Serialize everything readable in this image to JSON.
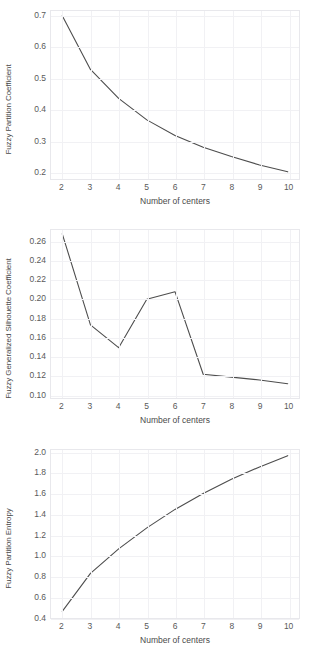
{
  "figure": {
    "background": "#ffffff",
    "line_color": "#4d4d4d",
    "grid_color": "#f1f1f4",
    "panel_border_color": "#e8e8ec"
  },
  "chart_data": [
    {
      "type": "line",
      "title": "",
      "xlabel": "Number of centers",
      "ylabel": "Fuzzy Partition Coefficient",
      "x": [
        2,
        3,
        4,
        5,
        6,
        7,
        8,
        9,
        10
      ],
      "values": [
        0.7,
        0.527,
        0.434,
        0.365,
        0.315,
        0.277,
        0.247,
        0.22,
        0.198
      ],
      "xlim": [
        1.6,
        10.4
      ],
      "ylim": [
        0.175,
        0.715
      ],
      "xticks": [
        2,
        3,
        4,
        5,
        6,
        7,
        8,
        9,
        10
      ],
      "xticklabels": [
        "2",
        "3",
        "4",
        "5",
        "6",
        "7",
        "8",
        "9",
        "10"
      ],
      "yticks": [
        0.2,
        0.3,
        0.4,
        0.5,
        0.6,
        0.7
      ],
      "yticklabels": [
        "0.2",
        "0.3",
        "0.4",
        "0.5",
        "0.6",
        "0.7"
      ],
      "grid": true,
      "legend": "none"
    },
    {
      "type": "line",
      "title": "",
      "xlabel": "Number of centers",
      "ylabel": "Fuzzy Generalized Silhouette Coefficient",
      "x": [
        2,
        3,
        4,
        5,
        6,
        7,
        8,
        9,
        10
      ],
      "values": [
        0.268,
        0.172,
        0.148,
        0.199,
        0.207,
        0.12,
        0.117,
        0.114,
        0.11
      ],
      "xlim": [
        1.6,
        10.4
      ],
      "ylim": [
        0.095,
        0.272
      ],
      "xticks": [
        2,
        3,
        4,
        5,
        6,
        7,
        8,
        9,
        10
      ],
      "xticklabels": [
        "2",
        "3",
        "4",
        "5",
        "6",
        "7",
        "8",
        "9",
        "10"
      ],
      "yticks": [
        0.1,
        0.12,
        0.14,
        0.16,
        0.18,
        0.2,
        0.22,
        0.24,
        0.26
      ],
      "yticklabels": [
        "0.10",
        "0.12",
        "0.14",
        "0.16",
        "0.18",
        "0.20",
        "0.22",
        "0.24",
        "0.26"
      ],
      "grid": true,
      "legend": "none"
    },
    {
      "type": "line",
      "title": "",
      "xlabel": "Number of centers",
      "ylabel": "Fuzzy Partition Entropy",
      "x": [
        2,
        3,
        4,
        5,
        6,
        7,
        8,
        9,
        10
      ],
      "values": [
        0.455,
        0.825,
        1.065,
        1.27,
        1.45,
        1.605,
        1.745,
        1.865,
        1.975
      ],
      "xlim": [
        1.6,
        10.4
      ],
      "ylim": [
        0.39,
        2.03
      ],
      "xticks": [
        2,
        3,
        4,
        5,
        6,
        7,
        8,
        9,
        10
      ],
      "xticklabels": [
        "2",
        "3",
        "4",
        "5",
        "6",
        "7",
        "8",
        "9",
        "10"
      ],
      "yticks": [
        0.4,
        0.6,
        0.8,
        1.0,
        1.2,
        1.4,
        1.6,
        1.8,
        2.0
      ],
      "yticklabels": [
        "0.4",
        "0.6",
        "0.8",
        "1.0",
        "1.2",
        "1.4",
        "1.6",
        "1.8",
        "2.0"
      ],
      "grid": true,
      "legend": "none"
    }
  ]
}
